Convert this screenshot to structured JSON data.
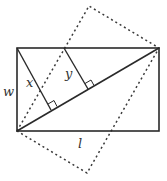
{
  "diagram": {
    "labels": {
      "w": "w",
      "l": "l",
      "x": "x",
      "y": "y"
    },
    "colors": {
      "stroke": "#2a2a2a",
      "dashed": "#3a3a3a",
      "background": "#ffffff"
    },
    "rectangle": {
      "x1": 17,
      "y1": 48,
      "x2": 159,
      "y2": 131
    },
    "rotated_rectangle_corners": [
      [
        17,
        131
      ],
      [
        89,
        6
      ],
      [
        159,
        48
      ],
      [
        87,
        173
      ]
    ],
    "perpendiculars": [
      {
        "from": [
          17,
          48
        ],
        "foot": [
          51,
          110
        ],
        "label": "x"
      },
      {
        "from": [
          64,
          48
        ],
        "foot": [
          88,
          88
        ],
        "label": "y"
      }
    ]
  }
}
